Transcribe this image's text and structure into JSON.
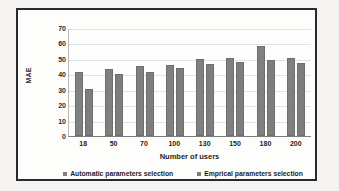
{
  "chart_data": {
    "type": "bar",
    "title": "",
    "xlabel": "Number of users",
    "ylabel": "MAE",
    "categories": [
      "18",
      "50",
      "70",
      "100",
      "130",
      "150",
      "180",
      "200"
    ],
    "yticks": [
      "70",
      "60",
      "50",
      "40",
      "30",
      "20",
      "10",
      "0"
    ],
    "ylim": [
      0,
      70
    ],
    "grid": true,
    "legend_position": "bottom",
    "series": [
      {
        "name": "Automatic parameters selection",
        "color": "#808080",
        "values": [
          41.5,
          43.5,
          45.5,
          46.0,
          50.2,
          50.7,
          58.3,
          50.6
        ]
      },
      {
        "name": "Emprical parameters selection",
        "color": "#7d7d7d",
        "values": [
          30.5,
          40.2,
          41.8,
          44.0,
          47.0,
          47.7,
          49.5,
          47.5
        ]
      }
    ]
  },
  "legend": {
    "items": [
      {
        "label": "Automatic parameters selection"
      },
      {
        "label": "Emprical parameters selection"
      }
    ]
  },
  "axes": {
    "y_title": "MAE",
    "x_title": "Number of users"
  }
}
